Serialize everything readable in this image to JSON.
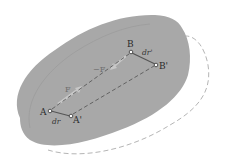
{
  "diagram": {
    "type": "rigid body displacement / work of internal forces",
    "colors": {
      "body_fill": "#a9a9a9",
      "body_inner_outline": "#9a9a9a",
      "displaced_outline": "#b0b0b0",
      "dashed_lines": "#5a5a5a",
      "force_arrows": "#c6c6c6",
      "displacement_segments": "#555555",
      "background": "#ffffff"
    },
    "points": {
      "A": {
        "label": "A",
        "x": 50,
        "y": 111
      },
      "A_prime": {
        "label": "A'",
        "x": 71,
        "y": 116
      },
      "B": {
        "label": "B",
        "x": 131,
        "y": 52
      },
      "B_prime": {
        "label": "B'",
        "x": 156,
        "y": 65
      }
    },
    "labels": {
      "A": "A",
      "A_prime": "A'",
      "B": "B",
      "B_prime": "B'",
      "force_F": "F",
      "force_neg_F": "−F",
      "dr_A": "dr",
      "dr_B": "dr'"
    }
  }
}
